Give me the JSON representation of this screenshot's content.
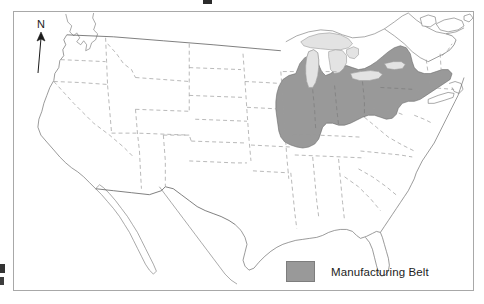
{
  "figure": {
    "kind": "thematic-map",
    "region": "United States",
    "background_color": "#ffffff",
    "frame_color": "#a8a8a8"
  },
  "compass": {
    "label": "N",
    "icon": "north-arrow-icon",
    "color": "#1b1b1b"
  },
  "legend": {
    "items": [
      {
        "label": "Manufacturing Belt",
        "swatch_color": "#999999",
        "swatch_border": "#7d7d7d"
      }
    ]
  },
  "map_layers": {
    "land_fill": "#ffffff",
    "coastline_color": "#6f6f6f",
    "state_border_color": "#9a9a9a",
    "state_border_style": "dashed",
    "national_border_color": "#5f5f5f",
    "lakes_fill": "#e3e3e3",
    "lakes_border": "#9a9a9a",
    "highlight_fill": "#999999",
    "highlight_border": "#6b6b6b",
    "highlight_name": "Manufacturing Belt"
  },
  "annotations": {
    "cut_off_title_fragment": "",
    "cut_off_left_fragments": ""
  }
}
